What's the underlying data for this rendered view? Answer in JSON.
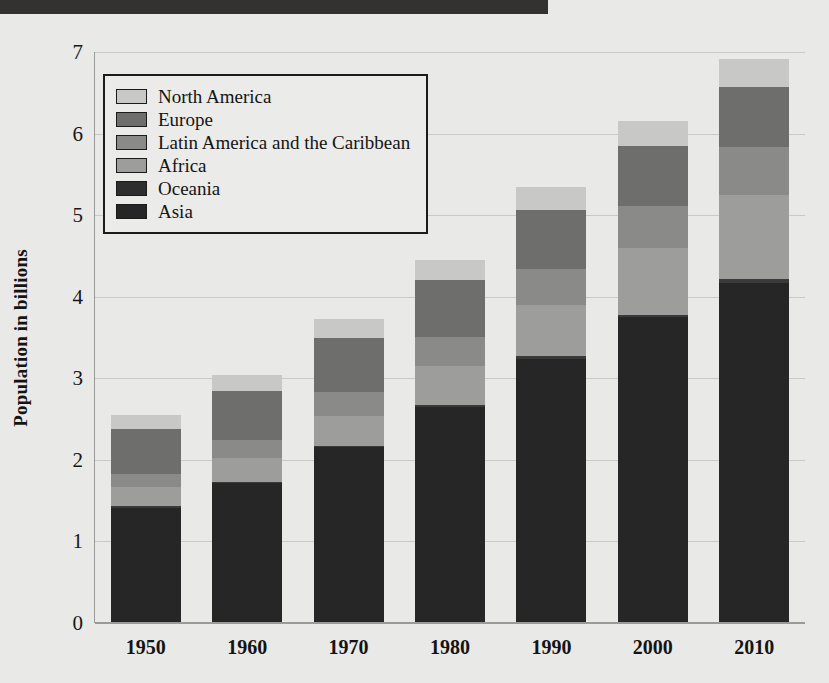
{
  "top_band": {
    "color": "#333230"
  },
  "chart_data": {
    "type": "bar",
    "subtype": "stacked-vertical",
    "title": "",
    "xlabel": "",
    "ylabel": "Population in billions",
    "ylim": [
      0,
      7
    ],
    "ytick_labels": [
      "7",
      "6",
      "5",
      "4",
      "3",
      "2",
      "1",
      "0"
    ],
    "ytick_values": [
      7,
      6,
      5,
      4,
      3,
      2,
      1,
      0
    ],
    "grid": true,
    "grid_axis": "y",
    "legend_position": "upper-left-inside",
    "categories": [
      "1950",
      "1960",
      "1970",
      "1980",
      "1990",
      "2000",
      "2010"
    ],
    "stack_order_bottom_to_top": [
      "Asia",
      "Oceania",
      "Africa",
      "Latin America and the Caribbean",
      "Europe",
      "North America"
    ],
    "series": [
      {
        "name": "Asia",
        "color": "#262626",
        "values": [
          1.4,
          1.7,
          2.14,
          2.64,
          3.23,
          3.74,
          4.16
        ]
      },
      {
        "name": "Oceania",
        "color": "#3a3a3a",
        "values": [
          0.02,
          0.02,
          0.02,
          0.02,
          0.03,
          0.03,
          0.04
        ]
      },
      {
        "name": "Africa",
        "color": "#9d9d9b",
        "values": [
          0.23,
          0.29,
          0.37,
          0.48,
          0.63,
          0.81,
          1.03
        ]
      },
      {
        "name": "Latin America and the Caribbean",
        "color": "#8a8a88",
        "values": [
          0.17,
          0.22,
          0.29,
          0.36,
          0.44,
          0.52,
          0.59
        ]
      },
      {
        "name": "Europe",
        "color": "#6e6e6c",
        "values": [
          0.55,
          0.6,
          0.66,
          0.69,
          0.72,
          0.73,
          0.74
        ]
      },
      {
        "name": "North America",
        "color": "#c8c8c6",
        "values": [
          0.17,
          0.2,
          0.23,
          0.25,
          0.28,
          0.31,
          0.34
        ]
      }
    ],
    "totals": [
      2.54,
      3.03,
      3.71,
      4.44,
      5.33,
      6.14,
      6.9
    ]
  },
  "legend": {
    "items": [
      {
        "label": "North America",
        "color": "#c8c8c6"
      },
      {
        "label": "Europe",
        "color": "#6e6e6c"
      },
      {
        "label": "Latin America and the Caribbean",
        "color": "#8a8a88"
      },
      {
        "label": "Africa",
        "color": "#9d9d9b"
      },
      {
        "label": "Oceania",
        "color": "#2e2e2e"
      },
      {
        "label": "Asia",
        "color": "#262626"
      }
    ]
  }
}
